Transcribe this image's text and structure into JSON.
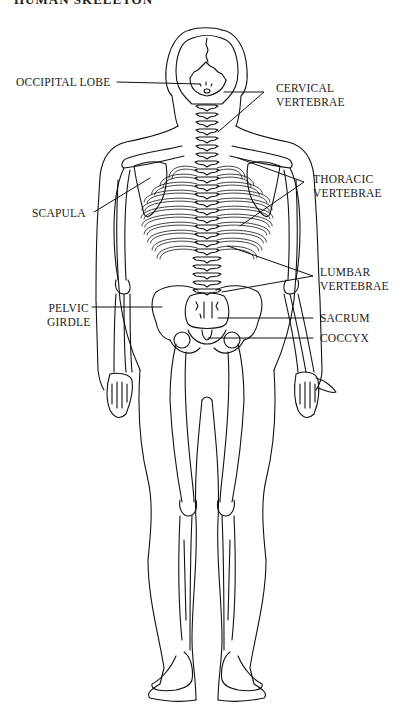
{
  "header": {
    "cutoff_title": "HUMAN SKELETON"
  },
  "figure": {
    "stroke_color": "#111111",
    "background": "#ffffff"
  },
  "labels": {
    "occipital_lobe": {
      "line1": "OCCIPITAL LOBE"
    },
    "cervical_vertebrae": {
      "line1": "CERVICAL",
      "line2": "VERTEBRAE"
    },
    "thoracic_vertebrae": {
      "line1": "THORACIC",
      "line2": "VERTEBRAE"
    },
    "scapula": {
      "line1": "SCAPULA"
    },
    "lumbar_vertebrae": {
      "line1": "LUMBAR",
      "line2": "VERTEBRAE"
    },
    "pelvic_girdle": {
      "line1": "PELVIC",
      "line2": "GIRDLE"
    },
    "sacrum": {
      "line1": "SACRUM"
    },
    "coccyx": {
      "line1": "COCCYX"
    }
  }
}
